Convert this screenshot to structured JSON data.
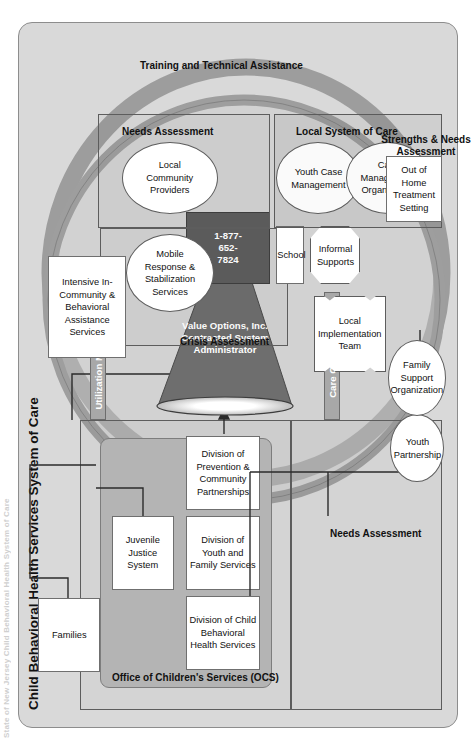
{
  "meta": {
    "clipped_top_title": "State of New Jersey Child Behavioral Health System of Care",
    "title": "Child Behavioral Health Services System of Care"
  },
  "colors": {
    "panel_bg": "#d9d9d9",
    "ocs_bg": "#b4b4b4",
    "greybar_bg": "#a8a8a8",
    "funnel_fill": "#6e6e6e",
    "box_white": "#ffffff",
    "line": "#2b2b2b",
    "band_light": "#c4c4c4",
    "band_dark": "#9a9a9a"
  },
  "ocs": {
    "label": "Office of Children's Services (OCS)",
    "divisions": [
      {
        "name": "division-child-behavioral-health",
        "label": "Division of Child Behavioral Health Services"
      },
      {
        "name": "division-youth-family",
        "label": "Division of Youth and Family Services"
      },
      {
        "name": "division-prevention-community",
        "label": "Division of Prevention & Community Partnerships"
      }
    ]
  },
  "stakeholders": [
    {
      "name": "families",
      "label": "Families"
    },
    {
      "name": "juvenile-justice-system",
      "label": "Juvenile Justice System"
    }
  ],
  "bars": [
    {
      "name": "care-coordination-bar",
      "label": "Care Coordination"
    },
    {
      "name": "utilization-management-bar",
      "label": "Utilization Management"
    }
  ],
  "administrator": {
    "name": "value-options-funnel",
    "line1": "Value Options, Inc.",
    "line2": "Contracted System",
    "line3": "Administrator",
    "phone": "1-877-652-7824",
    "phone_lines": [
      "1-877-",
      "652-",
      "7824"
    ]
  },
  "services": {
    "intensive": {
      "name": "intensive-in-community",
      "label": "Intensive In-Community & Behavioral Assistance Services"
    },
    "mobile": {
      "name": "mobile-response",
      "label": "Mobile Response & Stabilization Services"
    },
    "school": {
      "name": "school",
      "label": "School"
    },
    "informal": {
      "name": "informal-supports",
      "label": "Informal Supports"
    },
    "lit": {
      "name": "local-implementation-team",
      "label": "Local Implementation Team"
    },
    "youth_partnership": {
      "name": "youth-partnership",
      "label": "Youth Partnership"
    },
    "family_support": {
      "name": "family-support-organization",
      "label": "Family Support Organization"
    },
    "local_providers": {
      "name": "local-community-providers",
      "label": "Local Community Providers"
    },
    "youth_case_mgmt": {
      "name": "youth-case-management",
      "label": "Youth Case Management"
    },
    "care_mgmt_org": {
      "name": "care-management-organization",
      "label": "Care Management Organization"
    },
    "out_of_home": {
      "name": "out-of-home-treatment-setting",
      "label": "Out of Home Treatment Setting"
    }
  },
  "regions": {
    "needs_assessment_left": "Needs Assessment",
    "crisis_assessment": "Crisis Assessment",
    "needs_assessment_top": "Needs Assessment",
    "local_system_of_care": "Local System of Care",
    "strengths_needs": "Strengths & Needs Assessment",
    "training_ta": "Training and Technical Assistance"
  }
}
